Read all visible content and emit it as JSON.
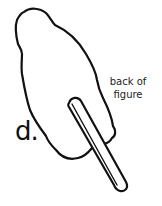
{
  "diagram": {
    "step_label": "d.",
    "annotation": "back of\nfigure",
    "annotation_lines": [
      "back of",
      "figure"
    ],
    "elements": [
      {
        "name": "figure-silhouette",
        "description": "outline of cut-out figure seen from the back"
      },
      {
        "name": "stick",
        "description": "craft stick attached to back of figure"
      }
    ],
    "colors": {
      "line": "#111111",
      "background": "#ffffff"
    }
  }
}
